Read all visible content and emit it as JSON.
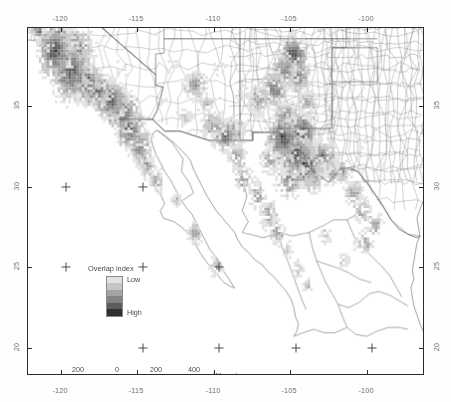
{
  "figure": {
    "kind": "thematic-map",
    "region": "Southwestern United States and northern Mexico"
  },
  "axes": {
    "x_label_values": [
      "-120",
      "-115",
      "-110",
      "-105",
      "-100"
    ],
    "y_label_values": [
      "35",
      "30",
      "25",
      "20"
    ],
    "x_unit": "degrees longitude",
    "y_unit": "degrees latitude",
    "xlim": [
      -123.0,
      -97.0
    ],
    "ylim": [
      18.3,
      37.6
    ]
  },
  "legend": {
    "title": "Overlap index",
    "low_label": "Low",
    "high_label": "High",
    "classes": 6,
    "colors": [
      "#e2e2e2",
      "#c6c6c6",
      "#a4a4a4",
      "#848484",
      "#5c5c5c",
      "#303030"
    ]
  },
  "scalebar": {
    "tick_labels": [
      "200",
      "0",
      "200",
      "400"
    ],
    "units": "Kilometers",
    "segments": [
      "#1e1e1e",
      "#ffffff",
      "#1e1e1e",
      "#ffffff",
      "#1e1e1e"
    ]
  },
  "map_style": {
    "frame_color": "#2b2b2b",
    "boundary_color": "#555555",
    "background": "#ffffff",
    "graticule_mark_color": "#4a4a4a"
  },
  "caption": "",
  "chart_data": {
    "type": "heatmap",
    "title": "Overlap index",
    "xlabel": "",
    "ylabel": "",
    "xlim": [
      -123.0,
      -97.0
    ],
    "ylim": [
      18.3,
      37.6
    ],
    "grid": false,
    "legend_position": "inside-lower-left",
    "colorbar_labels": [
      "Low",
      "High"
    ],
    "value_classes": [
      1,
      2,
      3,
      4,
      5,
      6
    ],
    "class_colors": [
      "#e2e2e2",
      "#c6c6c6",
      "#a4a4a4",
      "#848484",
      "#5c5c5c",
      "#303030"
    ],
    "clusters": [
      {
        "name": "California coast / Sierra Nevada",
        "center": [
          -119.0,
          35.0
        ],
        "intensity": "high"
      },
      {
        "name": "Southern California / Baja norte",
        "center": [
          -116.5,
          32.5
        ],
        "intensity": "high"
      },
      {
        "name": "Arizona / Sonora highlands",
        "center": [
          -110.5,
          31.0
        ],
        "intensity": "medium"
      },
      {
        "name": "Sierra Madre Occidental",
        "center": [
          -107.0,
          27.0
        ],
        "intensity": "medium"
      },
      {
        "name": "Chihuahua / Trans-Pecos Texas",
        "center": [
          -105.0,
          30.0
        ],
        "intensity": "high"
      },
      {
        "name": "New Mexico uplands",
        "center": [
          -106.0,
          33.5
        ],
        "intensity": "medium"
      }
    ]
  }
}
